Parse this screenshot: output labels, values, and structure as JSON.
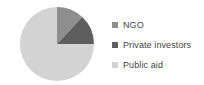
{
  "chart_data": {
    "type": "pie",
    "title": "",
    "subtitle": "",
    "xlabel": "",
    "ylabel": "",
    "grid": false,
    "legend_position": "right",
    "start_angle_deg": 0,
    "direction": "clockwise",
    "categories": [
      "NGO",
      "Private investors",
      "Public aid"
    ],
    "values": [
      12,
      13,
      75
    ],
    "units": "percent",
    "slices": [
      {
        "label": "NGO",
        "value": 12,
        "color": "#8e8e8e",
        "start_deg": 0,
        "end_deg": 43
      },
      {
        "label": "Private investors",
        "value": 13,
        "color": "#5e5e5e",
        "start_deg": 43,
        "end_deg": 90
      },
      {
        "label": "Public aid",
        "value": 75,
        "color": "#d3d3d3",
        "start_deg": 90,
        "end_deg": 360
      }
    ]
  },
  "legend": {
    "items": [
      {
        "label": "NGO",
        "color": "#8e8e8e",
        "swatch": "square-swatch-ngo"
      },
      {
        "label": "Private investors",
        "color": "#5e5e5e",
        "swatch": "square-swatch-private-investors"
      },
      {
        "label": "Public aid",
        "color": "#d3d3d3",
        "swatch": "square-swatch-public-aid"
      }
    ]
  },
  "colors": {
    "background": "#ffffff",
    "text": "#3f3f3f",
    "ngo": "#8e8e8e",
    "private_investors": "#5e5e5e",
    "public_aid": "#d3d3d3"
  }
}
